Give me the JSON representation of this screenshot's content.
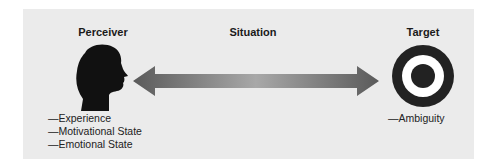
{
  "diagram": {
    "perceiver": {
      "title": "Perceiver",
      "icon": "human-head-silhouette",
      "factors": [
        "—Experience",
        "—Motivational State",
        "—Emotional State"
      ]
    },
    "situation": {
      "title": "Situation",
      "icon": "double-headed-arrow"
    },
    "target": {
      "title": "Target",
      "icon": "bullseye-target",
      "factors": [
        "—Ambiguity"
      ]
    },
    "colors": {
      "panel_background": "#ebebeb",
      "silhouette": "#111111",
      "arrow": "#6e6e6e",
      "target_ring": "#222222"
    }
  }
}
